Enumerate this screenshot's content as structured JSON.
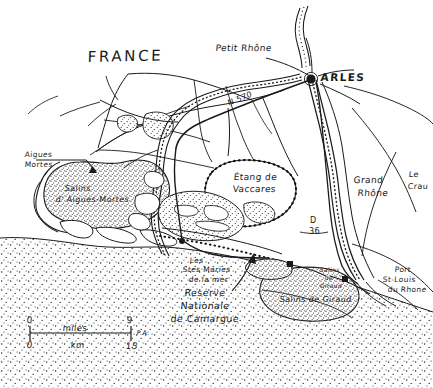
{
  "map": {
    "title": "FRANCE",
    "region_name": "Camargue",
    "style": "hand-drawn sketch map, black ink on white",
    "colors": {
      "ink": "#1a1a1a",
      "background": "#ffffff",
      "stipple": "#333333"
    },
    "labels": {
      "country": "FRANCE",
      "city_arles": "ARLES",
      "river_petit_rhone": "Petit Rhône",
      "river_grand_rhone_line1": "Grand",
      "river_grand_rhone_line2": "Rhône",
      "road_n570": "N 570",
      "road_d36_line1": "D",
      "road_d36_line2": "36",
      "aigues_mortes_line1": "Aigues",
      "aigues_mortes_line2": "Mortes",
      "salins_aigues_line1": "Salins",
      "salins_aigues_line2": "d' Aigues-Mortes",
      "etang_line1": "Étang de",
      "etang_line2": "Vaccares",
      "saintes_maries_line1": "Les",
      "saintes_maries_line2": "Stes Maries",
      "saintes_maries_line3": "de la mer",
      "reserve_line1": "Reserve",
      "reserve_line2": "Nationale",
      "reserve_line3": "de Camargue",
      "salins_giraud_small_line1": "Salins",
      "salins_giraud_small_line2": "de",
      "salins_giraud_small_line3": "Giraud",
      "salins_giraud_large": "Salins de Giraud",
      "port_st_louis_line1": "Port",
      "port_st_louis_line2": "St-Louis",
      "port_st_louis_line3": "du Rhone",
      "le_crau_line1": "Le",
      "le_crau_line2": "Crau"
    },
    "scale_bar": {
      "miles_label": "miles",
      "km_label": "km",
      "miles_min": "0",
      "miles_max": "9",
      "km_min": "0",
      "km_max": "15",
      "initials": "P.A."
    }
  }
}
